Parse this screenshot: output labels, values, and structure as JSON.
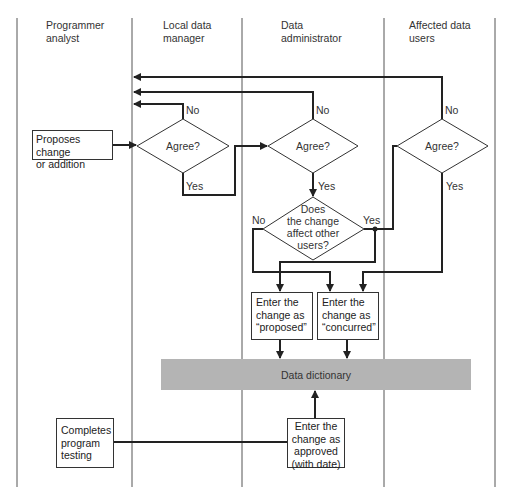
{
  "lanes": [
    {
      "label_line1": "Programmer",
      "label_line2": "analyst"
    },
    {
      "label_line1": "Local data",
      "label_line2": "manager"
    },
    {
      "label_line1": "Data",
      "label_line2": "administrator"
    },
    {
      "label_line1": "Affected data",
      "label_line2": "users"
    }
  ],
  "nodes": {
    "proposes": {
      "line1": "Proposes change",
      "line2": "or addition"
    },
    "agree_local": {
      "label": "Agree?"
    },
    "agree_admin": {
      "label": "Agree?"
    },
    "agree_users": {
      "label": "Agree?"
    },
    "affects": {
      "line1": "Does",
      "line2": "the change",
      "line3": "affect other",
      "line4": "users?"
    },
    "proposed": {
      "line1": "Enter the",
      "line2": "change as",
      "line3": "“proposed”"
    },
    "concurred": {
      "line1": "Enter the",
      "line2": "change as",
      "line3": "“concurred”"
    },
    "dictionary": {
      "label": "Data dictionary"
    },
    "completes": {
      "line1": "Completes",
      "line2": "program",
      "line3": "testing"
    },
    "approved": {
      "line1": "Enter the",
      "line2": "change as",
      "line3": "approved",
      "line4": "(with date)"
    }
  },
  "edge_labels": {
    "no_local": "No",
    "yes_local": "Yes",
    "no_admin": "No",
    "yes_admin": "Yes",
    "no_users": "No",
    "yes_users": "Yes",
    "no_affects": "No",
    "yes_affects": "Yes"
  },
  "colors": {
    "line": "#222222",
    "dictionary_fill": "#b4b4b4"
  }
}
